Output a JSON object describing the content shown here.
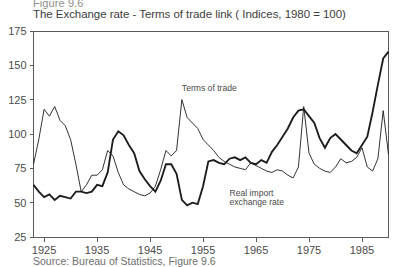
{
  "figure": {
    "number": "Figure 9.6",
    "title": "The Exchange rate - Terms of trade link ( Indices, 1980 = 100)",
    "source": "Source: Bureau of Statistics, Figure 9.6"
  },
  "chart_data": {
    "type": "line",
    "title": "The Exchange rate - Terms of trade link ( Indices, 1980 = 100)",
    "xlabel": "",
    "ylabel": "",
    "xlim": [
      1923,
      1990
    ],
    "ylim": [
      25,
      175
    ],
    "yticks": [
      25,
      50,
      75,
      100,
      125,
      150,
      175
    ],
    "xticks": [
      1925,
      1935,
      1945,
      1955,
      1965,
      1975,
      1985
    ],
    "grid": false,
    "legend": "in-plot annotations",
    "annotations": [
      {
        "label": "Terms of trade",
        "x": 1951,
        "y": 131
      },
      {
        "label": "Real import",
        "x": 1960,
        "y": 55
      },
      {
        "label": "exchange rate",
        "x": 1960,
        "y": 48
      }
    ],
    "x": [
      1923,
      1924,
      1925,
      1926,
      1927,
      1928,
      1929,
      1930,
      1931,
      1932,
      1933,
      1934,
      1935,
      1936,
      1937,
      1938,
      1939,
      1940,
      1941,
      1942,
      1943,
      1944,
      1945,
      1946,
      1947,
      1948,
      1949,
      1950,
      1951,
      1952,
      1953,
      1954,
      1955,
      1956,
      1957,
      1958,
      1959,
      1960,
      1961,
      1962,
      1963,
      1964,
      1965,
      1966,
      1967,
      1968,
      1969,
      1970,
      1971,
      1972,
      1973,
      1974,
      1975,
      1976,
      1977,
      1978,
      1979,
      1980,
      1981,
      1982,
      1983,
      1984,
      1985,
      1986,
      1987,
      1988,
      1989,
      1990
    ],
    "series": [
      {
        "name": "Terms of trade",
        "width": "thin",
        "values": [
          78,
          96,
          118,
          113,
          120,
          110,
          106,
          96,
          78,
          58,
          63,
          70,
          70,
          74,
          88,
          84,
          72,
          63,
          60,
          58,
          56,
          55,
          57,
          62,
          74,
          88,
          84,
          88,
          125,
          112,
          108,
          104,
          96,
          92,
          88,
          83,
          80,
          78,
          76,
          75,
          74,
          79,
          77,
          75,
          73,
          72,
          74,
          73,
          70,
          68,
          76,
          120,
          86,
          78,
          75,
          73,
          72,
          76,
          82,
          79,
          80,
          83,
          90,
          76,
          73,
          82,
          117,
          85
        ]
      },
      {
        "name": "Real import exchange rate",
        "width": "thick",
        "values": [
          63,
          58,
          54,
          56,
          52,
          55,
          54,
          53,
          58,
          58,
          57,
          58,
          63,
          62,
          72,
          96,
          102,
          99,
          92,
          86,
          73,
          67,
          62,
          58,
          66,
          78,
          78,
          71,
          52,
          48,
          50,
          49,
          62,
          80,
          81,
          79,
          78,
          82,
          83,
          81,
          83,
          79,
          78,
          81,
          79,
          87,
          92,
          98,
          104,
          112,
          117,
          118,
          113,
          108,
          97,
          90,
          97,
          100,
          96,
          92,
          88,
          86,
          92,
          98,
          116,
          136,
          155,
          160
        ]
      }
    ]
  }
}
